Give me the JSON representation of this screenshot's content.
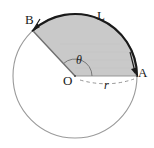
{
  "figure": {
    "background_color": "#ffffff",
    "width": 154,
    "height": 148
  },
  "geometry": {
    "center": {
      "x": 75,
      "y": 76
    },
    "radius": 62,
    "point_A": {
      "x": 137,
      "y": 74,
      "angle_deg": 0
    },
    "point_B": {
      "x": 32,
      "y": 28,
      "angle_deg": 133
    },
    "sector_start_angle_deg": 0,
    "sector_end_angle_deg": 133,
    "sector_fill": "#c9c9c9",
    "circle_stroke": "#9a9a9a",
    "arc_stroke": "#1a1a1a",
    "radius_stroke": "#6f6f6f",
    "dashed_stroke": "#8a8a8a"
  },
  "labels": {
    "point_b": "B",
    "arc_length": "L",
    "point_a": "A",
    "center": "O",
    "radius": "r",
    "angle": "θ"
  },
  "annotations": {
    "arrow_to_b": "arrow pointing to point B on circle",
    "arrow_to_a": "arrow pointing to point A on circle",
    "angle_arc": "small arc marking central angle theta at O",
    "radius_dashed": "dashed line from O to A labeled r"
  }
}
